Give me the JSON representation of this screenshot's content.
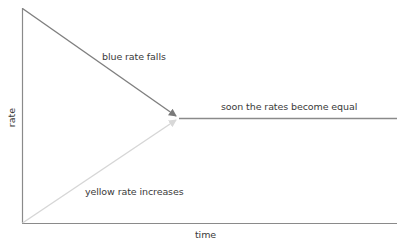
{
  "diagram": {
    "axes": {
      "y_label": "rate",
      "x_label": "time",
      "color": "#8a8a8a"
    },
    "annotations": {
      "blue_label": "blue rate falls",
      "equal_label": "soon the rates become equal",
      "yellow_label": "yellow rate increases"
    },
    "series": [
      {
        "name": "blue rate",
        "trend": "falls",
        "color": "#7f7f7f"
      },
      {
        "name": "yellow rate",
        "trend": "increases",
        "color": "#d6d6d6"
      },
      {
        "name": "equal rate",
        "trend": "constant",
        "color": "#8a8a8a"
      }
    ]
  }
}
